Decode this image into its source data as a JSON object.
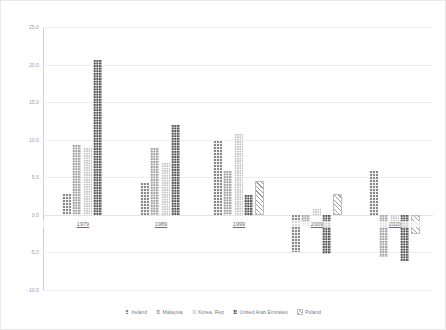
{
  "chart_data": {
    "type": "bar",
    "title": "",
    "subtitle": "",
    "xlabel": "",
    "ylabel": "",
    "categories": [
      "1979",
      "1989",
      "1999",
      "2009",
      "2020"
    ],
    "ylim": [
      -10.0,
      25.0
    ],
    "ytick_step": 5.0,
    "yticks": [
      "25.0",
      "20.0",
      "15.0",
      "10.0",
      "5.0",
      "0.0",
      "-5.0",
      "-10.0"
    ],
    "ytick_values": [
      25.0,
      20.0,
      15.0,
      10.0,
      5.0,
      0.0,
      -5.0,
      -10.0
    ],
    "grid": true,
    "legend_position": "bottom",
    "series": [
      {
        "name": "Ireland",
        "color": "#8a8a8a",
        "pattern": "checker",
        "values": [
          2.8,
          4.3,
          9.8,
          -5.0,
          5.9
        ]
      },
      {
        "name": "Malaysia",
        "color": "#9d9d9d",
        "pattern": "fine-checker",
        "values": [
          9.3,
          8.9,
          5.8,
          -1.5,
          -5.6
        ]
      },
      {
        "name": "Korea, Rep",
        "color": "#c4c4c4",
        "pattern": "light-dotted",
        "values": [
          8.9,
          6.9,
          10.7,
          0.8,
          -0.9
        ]
      },
      {
        "name": "United Arab Emirates",
        "color": "#4f4f4f",
        "pattern": "dark-checker",
        "values": [
          20.6,
          12.0,
          2.6,
          -5.2,
          -6.1
        ]
      },
      {
        "name": "Poland",
        "color": "#9e9e9e",
        "pattern": "diagonal-hatch",
        "values": [
          null,
          null,
          4.5,
          2.8,
          -2.5
        ]
      }
    ]
  },
  "legend": {
    "items": [
      {
        "label": "Ireland"
      },
      {
        "label": "Malaysia"
      },
      {
        "label": "Korea, Rep"
      },
      {
        "label": "United Arab Emirates"
      },
      {
        "label": "Poland"
      }
    ]
  }
}
